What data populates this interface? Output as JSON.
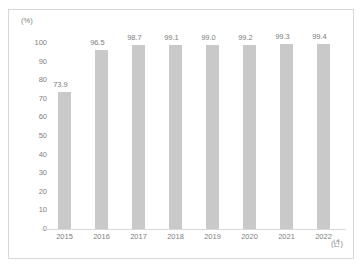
{
  "chart_data": {
    "type": "bar",
    "title": "",
    "xlabel": "(년)",
    "ylabel": "(%)",
    "categories": [
      "2015",
      "2016",
      "2017",
      "2018",
      "2019",
      "2020",
      "2021",
      "2022"
    ],
    "values": [
      73.9,
      96.5,
      98.7,
      99.1,
      99.0,
      99.2,
      99.3,
      99.4
    ],
    "value_labels": [
      "73.9",
      "96.5",
      "98.7",
      "99.1",
      "99.0",
      "99.2",
      "99.3",
      "99.4"
    ],
    "ylim": [
      0,
      100
    ],
    "ytick_labels": [
      "100",
      "90",
      "80",
      "70",
      "60",
      "50",
      "40",
      "30",
      "20",
      "10",
      "0"
    ],
    "ytick_values": [
      100,
      90,
      80,
      70,
      60,
      50,
      40,
      30,
      20,
      10,
      0
    ],
    "grid": false,
    "legend": null,
    "bar_color": "#c9c9c9",
    "text_color": "#808080",
    "frame_color": "#d8d8d8",
    "axis_color": "#d9d9d9"
  }
}
